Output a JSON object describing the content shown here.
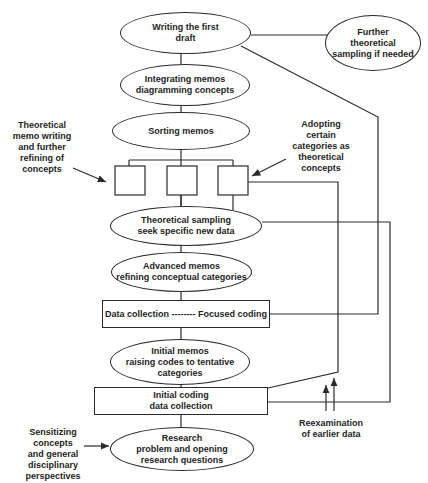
{
  "diagram": {
    "nodes": {
      "writing_draft": [
        "Writing the first",
        "draft"
      ],
      "further_sampling": [
        "Further",
        "theoretical",
        "sampling if needed"
      ],
      "integrating_memos": [
        "Integrating memos",
        "diagramming concepts"
      ],
      "sorting_memos": [
        "Sorting memos"
      ],
      "theoretical_sampling": [
        "Theoretical sampling",
        "seek specific new data"
      ],
      "advanced_memos": [
        "Advanced memos",
        "refining conceptual categories"
      ],
      "data_collection_focused": [
        "Data collection -------- Focused coding"
      ],
      "initial_memos": [
        "Initial memos",
        "raising codes to tentative",
        "categories"
      ],
      "initial_coding": [
        "Initial coding",
        "data collection"
      ],
      "research_problem": [
        "Research",
        "problem and opening",
        "research questions"
      ]
    },
    "annotations": {
      "theoretical_memo_writing": [
        "Theoretical",
        "memo writing",
        "and further",
        "refining of",
        "concepts"
      ],
      "adopting_categories": [
        "Adopting",
        "certain",
        "categories as",
        "theoretical",
        "concepts"
      ],
      "sensitizing_concepts": [
        "Sensitizing concepts",
        "and general",
        "disciplinary",
        "perspectives"
      ],
      "reexamination": [
        "Reexamination",
        "of earlier data"
      ]
    },
    "colors": {
      "stroke": "#2a2a2a",
      "text": "#1e1e1e",
      "background": "#ffffff"
    }
  }
}
